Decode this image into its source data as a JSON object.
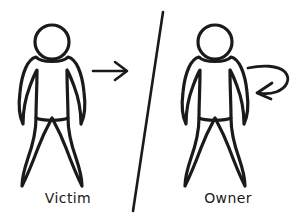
{
  "diagram": {
    "type": "stick-figure-attack-diagram",
    "background_color": "#ffffff",
    "stroke_color": "#1a1a1a",
    "panels": [
      {
        "id": "left-panel",
        "figure": {
          "name": "victim-figure",
          "icon": "person-icon",
          "label": "Victim"
        },
        "annotation": {
          "name": "straight-arrow",
          "icon": "arrow-right-icon",
          "direction": "right",
          "label": ""
        }
      },
      {
        "id": "right-panel",
        "figure": {
          "name": "owner-figure",
          "icon": "person-icon",
          "label": "Owner"
        },
        "annotation": {
          "name": "curved-arrow",
          "icon": "arrow-curve-loop-back-icon",
          "direction": "loop-back-left",
          "label": ""
        }
      }
    ],
    "divider": {
      "name": "diagonal-divider",
      "icon": "slash-divider-icon",
      "orientation": "diagonal"
    }
  }
}
